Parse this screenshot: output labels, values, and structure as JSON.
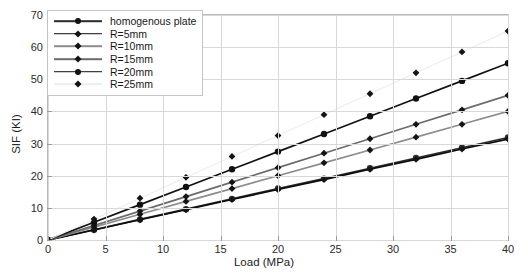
{
  "chart_data": {
    "type": "line",
    "title": "",
    "xlabel": "Load (MPa)",
    "ylabel": "SIF (KI)",
    "xlim": [
      0,
      40
    ],
    "ylim": [
      0,
      70
    ],
    "xticks": [
      0,
      5,
      10,
      15,
      20,
      25,
      30,
      35,
      40
    ],
    "yticks": [
      0,
      10,
      20,
      30,
      40,
      50,
      60,
      70
    ],
    "grid": true,
    "legend_position": "upper-left",
    "x": [
      0,
      4,
      8,
      12,
      16,
      20,
      24,
      28,
      32,
      36,
      40
    ],
    "series": [
      {
        "name": "homogenous plate",
        "marker": "circle",
        "color": "#2a2a2a",
        "values": [
          0,
          3.2,
          6.4,
          9.6,
          12.8,
          16.0,
          19.1,
          22.3,
          25.5,
          28.7,
          31.9
        ]
      },
      {
        "name": "R=5mm",
        "marker": "diamond",
        "color": "#0d0d0d",
        "values": [
          0,
          3.1,
          6.3,
          9.4,
          12.6,
          15.7,
          18.8,
          22.0,
          25.1,
          28.3,
          31.4
        ]
      },
      {
        "name": "R=10mm",
        "marker": "diamond",
        "color": "#8d8d8d",
        "values": [
          0,
          4.0,
          8.0,
          12.0,
          16.0,
          20.0,
          24.0,
          28.0,
          32.0,
          36.0,
          40.0
        ]
      },
      {
        "name": "R=15mm",
        "marker": "diamond",
        "color": "#6b6b6b",
        "values": [
          0,
          4.5,
          9.0,
          13.5,
          18.0,
          22.5,
          27.0,
          31.5,
          36.0,
          40.5,
          45.0
        ]
      },
      {
        "name": "R=20mm",
        "marker": "circle",
        "color": "#111111",
        "values": [
          0,
          5.5,
          11.0,
          16.5,
          22.0,
          27.5,
          33.0,
          38.5,
          44.0,
          49.5,
          55.0
        ]
      },
      {
        "name": "R=25mm",
        "marker": "diamond",
        "color": "#ededed",
        "values": [
          0,
          6.5,
          13.0,
          19.5,
          26.0,
          32.5,
          39.0,
          45.5,
          52.0,
          58.5,
          65.0
        ]
      }
    ]
  },
  "axis": {
    "y_title": "SIF (KI)",
    "x_title": "Load (MPa)",
    "y_tick_labels": [
      "0",
      "10",
      "20",
      "30",
      "40",
      "50",
      "60",
      "70"
    ],
    "x_tick_labels": [
      "0",
      "5",
      "10",
      "15",
      "20",
      "25",
      "30",
      "35",
      "40"
    ]
  },
  "legend": {
    "items": [
      {
        "label": "homogenous plate"
      },
      {
        "label": "R=5mm"
      },
      {
        "label": "R=10mm"
      },
      {
        "label": "R=15mm"
      },
      {
        "label": "R=20mm"
      },
      {
        "label": "R=25mm"
      }
    ]
  },
  "colors": {
    "grid": "#d8d8d8",
    "frame": "#b9b9b9",
    "text": "#1d1d1d",
    "background": "#ffffff"
  }
}
